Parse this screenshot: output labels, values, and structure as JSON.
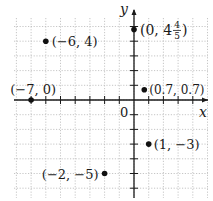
{
  "chart_data": {
    "type": "scatter",
    "title": "",
    "xlabel": "x",
    "ylabel": "y",
    "origin_label": "0",
    "xlim": [
      -8,
      5
    ],
    "ylim": [
      -6,
      6
    ],
    "grid": true,
    "grid_style": "dotted",
    "tick_spacing": 1,
    "points": [
      {
        "x": -6,
        "y": 4,
        "label": "(−6, 4)"
      },
      {
        "x": 0,
        "y": 4.8,
        "label": "(0, 4 4/5)",
        "label_whole": "(0, 4",
        "label_num": "4",
        "label_den": "5",
        "label_close": ")"
      },
      {
        "x": -7,
        "y": 0,
        "label": "(−7, 0)"
      },
      {
        "x": 0.7,
        "y": 0.7,
        "label": "(0.7, 0.7)"
      },
      {
        "x": 1,
        "y": -3,
        "label": "(1, −3)"
      },
      {
        "x": -2,
        "y": -5,
        "label": "(−2, −5)"
      }
    ]
  },
  "colors": {
    "axis": "#1a1a1a",
    "grid": "#b8b8b8",
    "point": "#111111"
  }
}
